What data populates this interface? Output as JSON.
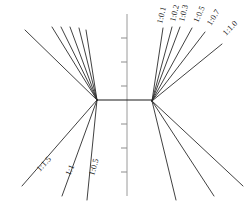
{
  "figure": {
    "width": 250,
    "height": 205,
    "background": "#ffffff",
    "line_color": "#2b2b2b",
    "axis_color": "#9a9a9a",
    "label_color": "#1c1c1c"
  },
  "axis": {
    "name": "vertical-center-axis",
    "x": 127,
    "y_top": 14,
    "y_bottom": 196,
    "ticks": [
      {
        "y": 38,
        "length": 6
      },
      {
        "y": 62,
        "length": 6
      },
      {
        "y": 86,
        "length": 6
      },
      {
        "y": 124,
        "length": 6
      },
      {
        "y": 148,
        "length": 6
      },
      {
        "y": 172,
        "length": 6
      }
    ]
  },
  "hubs": {
    "left": {
      "x": 97,
      "y": 100
    },
    "right": {
      "x": 152,
      "y": 101
    },
    "connector_y": 100
  },
  "fans": [
    {
      "name": "upper-left-fan",
      "origin": "left-hub",
      "labeled": false,
      "rays": [
        {
          "x2": 25,
          "y2": 30,
          "label": ""
        },
        {
          "x2": 52,
          "y2": 27,
          "label": ""
        },
        {
          "x2": 61,
          "y2": 27,
          "label": ""
        },
        {
          "x2": 70,
          "y2": 27,
          "label": ""
        },
        {
          "x2": 79,
          "y2": 28,
          "label": ""
        },
        {
          "x2": 86,
          "y2": 30,
          "label": ""
        }
      ]
    },
    {
      "name": "upper-right-fan",
      "origin": "right-hub",
      "labeled": true,
      "rays": [
        {
          "x2": 163,
          "y2": 28,
          "label": "1:0.1",
          "lx": 162,
          "ly": 24
        },
        {
          "x2": 172,
          "y2": 27,
          "label": "1:0.2",
          "lx": 175,
          "ly": 22
        },
        {
          "x2": 180,
          "y2": 27,
          "label": "1:0.3",
          "lx": 184,
          "ly": 22
        },
        {
          "x2": 192,
          "y2": 28,
          "label": "1:0.5",
          "lx": 198,
          "ly": 23
        },
        {
          "x2": 205,
          "y2": 32,
          "label": "1:0.7",
          "lx": 211,
          "ly": 26
        },
        {
          "x2": 222,
          "y2": 44,
          "label": "1:1.0",
          "lx": 226,
          "ly": 36
        }
      ]
    },
    {
      "name": "lower-left-fan",
      "origin": "left-hub",
      "labeled": true,
      "rays": [
        {
          "x2": 22,
          "y2": 186,
          "label": "1:1.5",
          "lx": 40,
          "ly": 172
        },
        {
          "x2": 62,
          "y2": 196,
          "label": "1:1",
          "lx": 70,
          "ly": 176
        },
        {
          "x2": 87,
          "y2": 200,
          "label": "1:0.5",
          "lx": 94,
          "ly": 176
        }
      ]
    },
    {
      "name": "lower-right-fan",
      "origin": "right-hub",
      "labeled": false,
      "rays": [
        {
          "x2": 176,
          "y2": 200,
          "label": ""
        },
        {
          "x2": 214,
          "y2": 196,
          "label": ""
        },
        {
          "x2": 243,
          "y2": 186,
          "label": ""
        }
      ]
    }
  ]
}
